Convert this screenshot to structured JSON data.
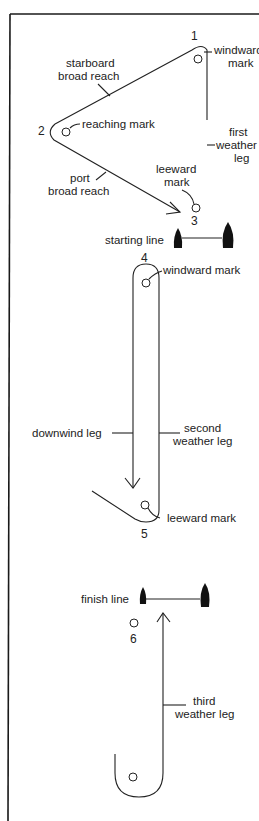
{
  "diagram": {
    "type": "sailing-race-course",
    "colors": {
      "line": "#222222",
      "boat": "#111111",
      "background": "#ffffff"
    },
    "course1": {
      "marks": [
        {
          "number": "1",
          "label_lines": [
            "windward",
            "mark"
          ]
        },
        {
          "number": "2",
          "label_lines": [
            "reaching mark"
          ]
        },
        {
          "number": "3",
          "label_lines": [
            "leeward",
            "mark"
          ]
        }
      ],
      "legs": {
        "starboard": [
          "starboard",
          "broad reach"
        ],
        "port": [
          "port",
          "broad reach"
        ],
        "first_weather": [
          "first",
          "weather",
          "leg"
        ]
      },
      "starting_line": "starting line"
    },
    "course2": {
      "marks": [
        {
          "number": "4",
          "label": "windward mark"
        },
        {
          "number": "5",
          "label": "leeward mark"
        }
      ],
      "legs": {
        "downwind": "downwind leg",
        "second_weather": [
          "second",
          "weather leg"
        ]
      }
    },
    "course3": {
      "finish_line": "finish line",
      "mark_number": "6",
      "legs": {
        "third_weather": [
          "third",
          "weather leg"
        ]
      }
    }
  }
}
